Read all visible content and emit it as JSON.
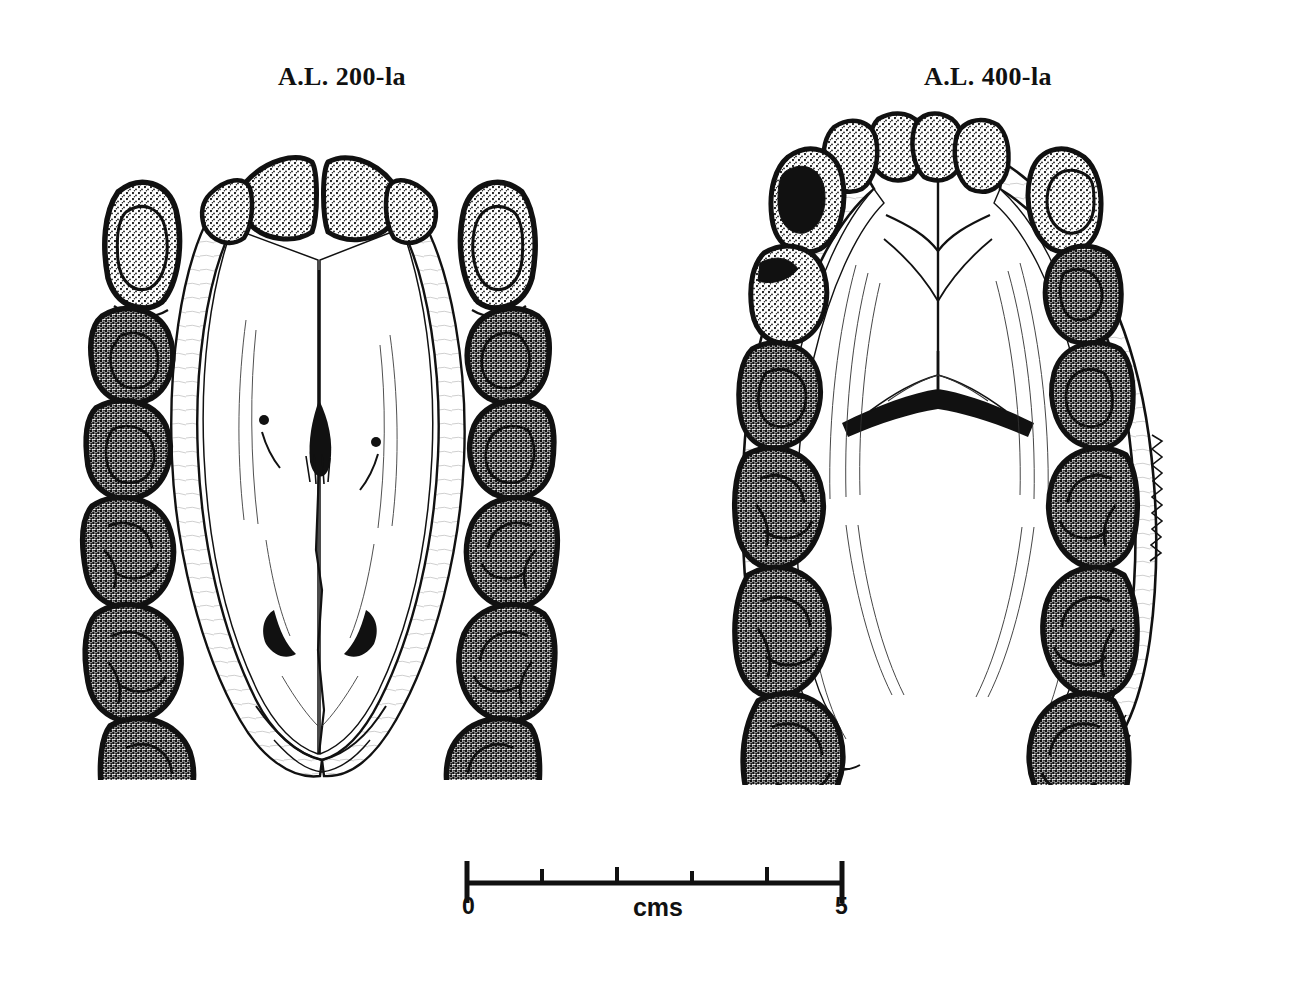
{
  "figure": {
    "kind": "scientific-illustration",
    "background_color": "#ffffff",
    "ink_color": "#111111"
  },
  "specimens": [
    {
      "id": "left",
      "label": "A.L. 200-la",
      "view": "occlusal",
      "element": "maxilla",
      "name": "maxilla-occlusal-drawing"
    },
    {
      "id": "right",
      "label": "A.L. 400-la",
      "view": "occlusal",
      "element": "mandible",
      "name": "mandible-occlusal-drawing"
    }
  ],
  "scalebar": {
    "unit_label": "cms",
    "start_label": "0",
    "end_label": "5",
    "ticks": [
      0,
      1,
      2,
      3,
      4,
      5
    ],
    "major_ticks": [
      0,
      5
    ],
    "length_cm": 5
  }
}
